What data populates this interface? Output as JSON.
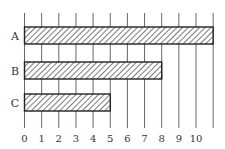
{
  "chart_data": {
    "type": "bar",
    "orientation": "horizontal",
    "title": "",
    "xlabel": "",
    "ylabel": "",
    "categories": [
      "A",
      "B",
      "C"
    ],
    "values": [
      11,
      8,
      5
    ],
    "x_ticks": [
      "0",
      "1",
      "2",
      "3",
      "4",
      "5",
      "6",
      "7",
      "8",
      "9",
      "10"
    ],
    "xlim": [
      0,
      11
    ],
    "grid": "vertical",
    "bar_fill": "diagonal-hatch",
    "legend": null
  },
  "colors": {
    "bar_stroke": "#222222",
    "hatch": "#333333",
    "grid": "#555555",
    "background": "#ffffff"
  }
}
